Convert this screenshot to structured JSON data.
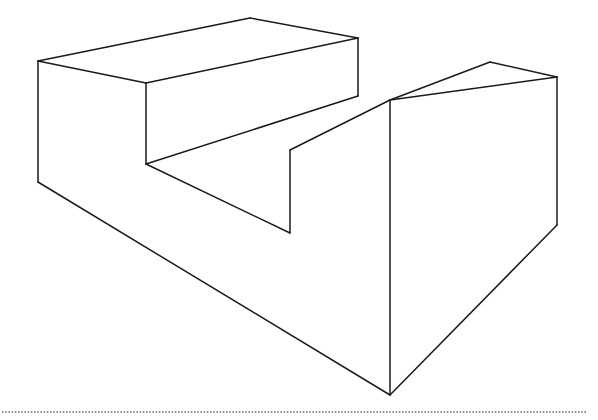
{
  "page": {
    "width": 598,
    "height": 420,
    "background_color": "#ffffff"
  },
  "figure": {
    "name": "step-block",
    "line_color": "#1a1a1a",
    "fill_color": "#ffffff",
    "stroke_width": 1.5,
    "faces": [
      {
        "name": "upper-slab-top-face",
        "points": "38,61 250,18 358,38 146,83"
      },
      {
        "name": "upper-slab-front-face",
        "points": "146,83 358,38 358,96 146,164"
      },
      {
        "name": "lower-slab-top-face",
        "points": "38,61 146,83 146,164 290,233 290,150 390,100 490,62 557,77 390,395 38,182"
      },
      {
        "name": "right-arm-top-face",
        "points": "290,150 390,100 490,62 557,77 451,118"
      },
      {
        "name": "right-arm-front-face",
        "points": "290,150 451,118 557,77 557,225 390,395 290,233"
      },
      {
        "name": "base-left-front-face",
        "points": "38,61 38,182 390,395 390,100 146,164 146,83"
      }
    ],
    "edges": [
      {
        "name": "top-face-left-back-edge",
        "points": "38,61 250,18"
      },
      {
        "name": "top-face-right-back-edge",
        "points": "250,18 358,38"
      },
      {
        "name": "top-face-front-right-edge",
        "points": "358,38 146,83"
      },
      {
        "name": "top-face-front-left-edge",
        "points": "146,83 38,61"
      },
      {
        "name": "upper-slab-right-vertical-edge",
        "points": "358,38 358,96"
      },
      {
        "name": "upper-slab-front-bottom-edge",
        "points": "358,96 146,164"
      },
      {
        "name": "upper-slab-left-vertical-edge",
        "points": "146,83 146,164"
      },
      {
        "name": "notch-floor-edge",
        "points": "146,164 290,233"
      },
      {
        "name": "notch-inner-vertical-edge",
        "points": "290,233 290,150"
      },
      {
        "name": "notch-top-edge-to-junction",
        "points": "290,150 390,100"
      },
      {
        "name": "right-arm-top-back-left-edge",
        "points": "390,100 490,62"
      },
      {
        "name": "right-arm-top-back-right-edge",
        "points": "490,62 557,77"
      },
      {
        "name": "right-arm-top-front-edge",
        "points": "557,77 390,100"
      },
      {
        "name": "right-arm-right-vertical-edge",
        "points": "557,77 557,225"
      },
      {
        "name": "right-arm-front-bottom-edge",
        "points": "557,225 390,395"
      },
      {
        "name": "base-bottom-left-edge",
        "points": "390,395 38,182"
      },
      {
        "name": "base-left-vertical-edge",
        "points": "38,182 38,61"
      },
      {
        "name": "base-center-vertical-edge",
        "points": "390,100 390,395"
      }
    ]
  },
  "footer_rule": {
    "name": "dotted-separator",
    "color": "#6f6f6f",
    "y": 412,
    "x_start": 2,
    "x_end": 586,
    "style": "dotted"
  }
}
